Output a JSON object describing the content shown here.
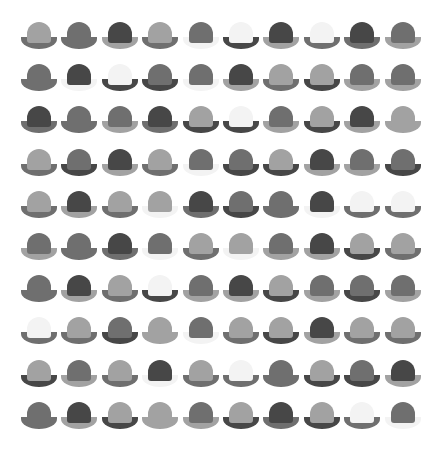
{
  "palette": {
    "W": "#f3f3f3",
    "L": "#a2a2a2",
    "M": "#6f6f6f",
    "D": "#474747"
  },
  "grid": {
    "rows": 10,
    "cols": 10,
    "hats": [
      [
        "L/M",
        "M/M",
        "D/L",
        "L/M",
        "M/W",
        "W/D",
        "D/L",
        "W/M",
        "D/M",
        "M/L"
      ],
      [
        "M/M",
        "D/W",
        "W/D",
        "M/D",
        "M/W",
        "D/L",
        "L/M",
        "L/D",
        "M/L",
        "M/L"
      ],
      [
        "D/M",
        "M/M",
        "M/L",
        "D/M",
        "L/D",
        "W/D",
        "M/L",
        "L/D",
        "D/L",
        "L/L"
      ],
      [
        "L/M",
        "M/D",
        "D/L",
        "L/M",
        "M/W",
        "M/D",
        "L/D",
        "D/L",
        "M/L",
        "M/D"
      ],
      [
        "L/M",
        "D/L",
        "L/M",
        "L/W",
        "D/M",
        "M/D",
        "M/M",
        "D/W",
        "W/M",
        "W/M"
      ],
      [
        "M/L",
        "M/M",
        "D/M",
        "M/W",
        "L/M",
        "L/W",
        "M/L",
        "D/L",
        "L/D",
        "L/M"
      ],
      [
        "M/M",
        "D/L",
        "L/M",
        "W/D",
        "M/L",
        "D/L",
        "L/D",
        "M/L",
        "M/D",
        "M/L"
      ],
      [
        "W/M",
        "L/M",
        "M/D",
        "L/L",
        "M/W",
        "L/M",
        "L/D",
        "D/L",
        "L/M",
        "L/M"
      ],
      [
        "L/D",
        "M/L",
        "L/M",
        "D/W",
        "L/M",
        "W/M",
        "M/M",
        "L/D",
        "M/D",
        "D/L"
      ],
      [
        "M/M",
        "D/L",
        "L/D",
        "L/L",
        "M/L",
        "L/D",
        "D/M",
        "L/D",
        "W/M",
        "M/W"
      ]
    ]
  }
}
